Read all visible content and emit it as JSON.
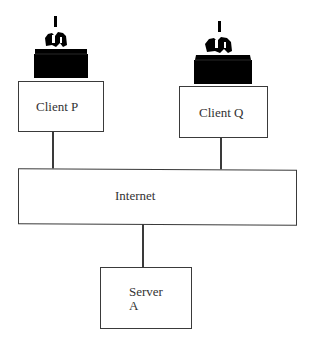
{
  "diagram": {
    "type": "network-topology",
    "nodes": [
      {
        "id": "client-p",
        "label": "Client P",
        "kind": "client",
        "icon": "computer-user-icon"
      },
      {
        "id": "client-q",
        "label": "Client Q",
        "kind": "client",
        "icon": "computer-user-icon"
      },
      {
        "id": "internet",
        "label": "Internet",
        "kind": "network"
      },
      {
        "id": "server-a",
        "label_line1": "Server",
        "label_line2": "A",
        "kind": "server"
      }
    ],
    "edges": [
      {
        "from": "client-p",
        "to": "internet"
      },
      {
        "from": "client-q",
        "to": "internet"
      },
      {
        "from": "internet",
        "to": "server-a"
      }
    ],
    "colors": {
      "line": "#3a3a3a",
      "icon": "#000000",
      "background": "#ffffff"
    }
  }
}
